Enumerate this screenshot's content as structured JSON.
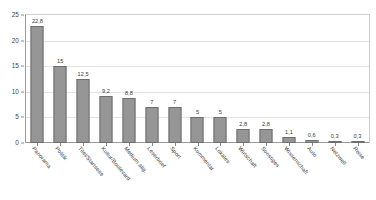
{
  "chart_data": {
    "type": "bar",
    "title": "",
    "subtitle": "",
    "xlabel": "",
    "ylabel": "",
    "ylim": [
      0,
      25
    ],
    "yticks": [
      "0",
      "5",
      "10",
      "15",
      "20",
      "25"
    ],
    "ytick_values": [
      0,
      5,
      10,
      15,
      20,
      25
    ],
    "grid": true,
    "legend": "none",
    "bar_color": "#969696",
    "bar_edge_color": "#6e6e6e",
    "frame_color": "#cfcfcf",
    "axis_color": "#9a9a9a",
    "gridline_color": "#e3e3e3",
    "categories": [
      "Panorama",
      "Politik",
      "Titel/Startseite",
      "Kultur/Boulevard",
      "Medium allg.",
      "Leserbrief",
      "Sport",
      "Kommentar",
      "Lokales",
      "Wirtschaft",
      "Sonstiges",
      "Wissenschaft",
      "Auto",
      "Netzwelt",
      "Reise"
    ],
    "values": [
      22.8,
      15,
      12.5,
      9.2,
      8.8,
      7,
      7,
      5,
      5,
      2.8,
      2.8,
      1.1,
      0.6,
      0.3,
      0.3
    ],
    "value_labels": [
      "22,8",
      "15",
      "12,5",
      "9,2",
      "8,8",
      "7",
      "7",
      "5",
      "5",
      "2,8",
      "2,8",
      "1,1",
      "0,6",
      "0,3",
      "0,3"
    ]
  }
}
